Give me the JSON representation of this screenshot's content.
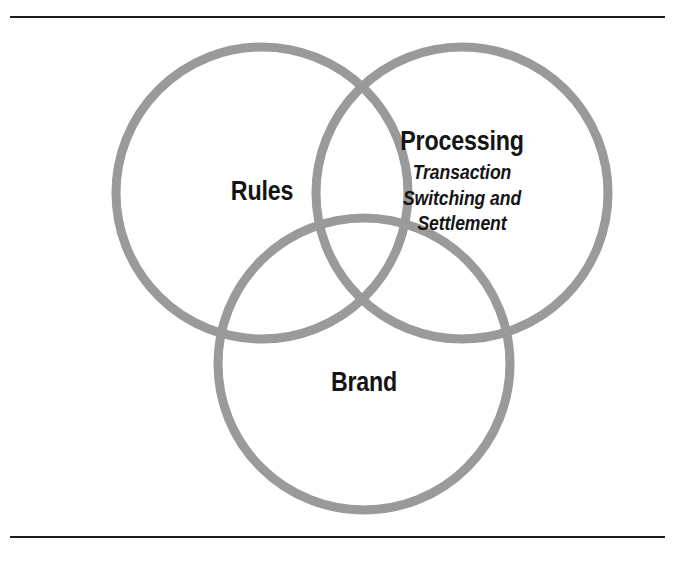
{
  "figure": {
    "type": "venn-diagram",
    "title": "",
    "width": 673,
    "height": 561,
    "background_color": "#ffffff",
    "circle_stroke_color": "#9a9a9a",
    "text_color": "#141414",
    "rule_color": "#1c1c1c"
  },
  "rules": {
    "top_label": "top-divider-rule",
    "bottom_label": "bottom-divider-rule"
  },
  "chart_data": {
    "type": "venn",
    "set_count": 3,
    "sets": [
      {
        "id": "rules",
        "heading": "Rules",
        "subtext_lines": [],
        "cx": 262,
        "cy": 193,
        "r": 146
      },
      {
        "id": "processing",
        "heading": "Processing",
        "subtext_lines": [
          "Transaction",
          "Switching and",
          "Settlement"
        ],
        "cx": 462,
        "cy": 193,
        "r": 146
      },
      {
        "id": "brand",
        "heading": "Brand",
        "subtext_lines": [],
        "cx": 364,
        "cy": 364,
        "r": 146
      }
    ],
    "stroke_color": "#9a9a9a",
    "stroke_width": 9,
    "fill": "none",
    "legend": "none",
    "grid": false
  },
  "labels": {
    "rules": {
      "heading": "Rules"
    },
    "processing": {
      "heading": "Processing",
      "line1": "Transaction",
      "line2": "Switching and",
      "line3": "Settlement"
    },
    "brand": {
      "heading": "Brand"
    }
  }
}
